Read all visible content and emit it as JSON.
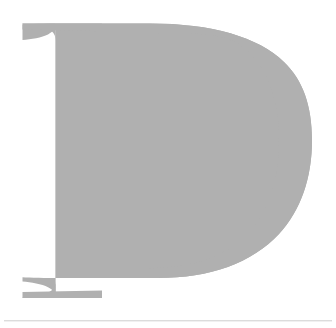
{
  "page": {
    "background_color": "#ffffff",
    "width": 336,
    "height": 328
  },
  "dropcap": {
    "letter": "D",
    "color": "#b0b0b0",
    "typeface_style": "serif",
    "case": "uppercase",
    "bounds": {
      "x": 22,
      "y": 24,
      "width": 286,
      "height": 274
    }
  },
  "divider": {
    "color": "#dcdcdc",
    "secondary_color": "#f0f0f0",
    "y": 320,
    "x": 4,
    "width": 328,
    "thickness": 1
  }
}
